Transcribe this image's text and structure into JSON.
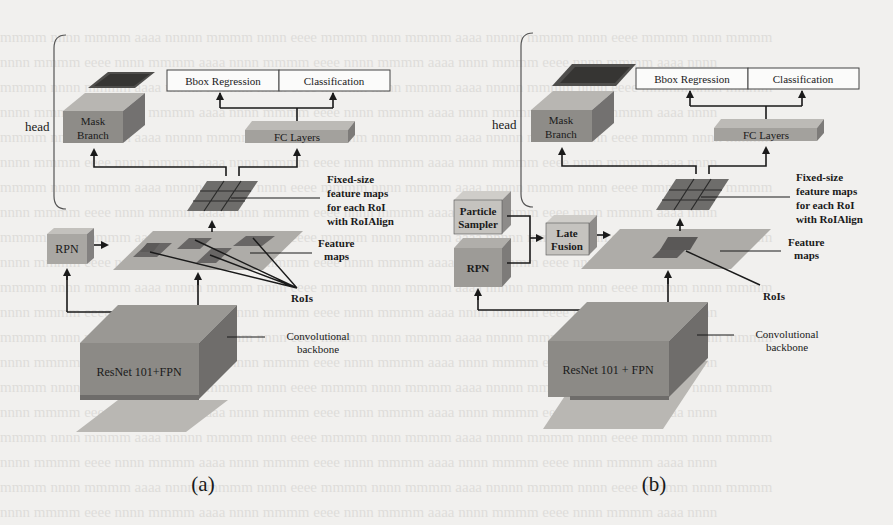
{
  "figure": {
    "panels": [
      {
        "id": "a",
        "caption": "(a)",
        "head_label": "head",
        "output_boxes": [
          "Bbox Regression",
          "Classification"
        ],
        "fc_layers": "FC Layers",
        "mask_branch": [
          "Mask",
          "Branch"
        ],
        "fixed_size_label": [
          "Fixed-size",
          "feature maps",
          "for each RoI",
          "with RoIAlign"
        ],
        "feature_maps_label": [
          "Feature",
          "maps"
        ],
        "rpn": "RPN",
        "rois_label": "RoIs",
        "backbone_label": [
          "Convolutional",
          "backbone"
        ],
        "backbone_box": "ResNet 101+FPN"
      },
      {
        "id": "b",
        "caption": "(b)",
        "head_label": "head",
        "output_boxes": [
          "Bbox Regression",
          "Classification"
        ],
        "fc_layers": "FC Layers",
        "mask_branch": [
          "Mask",
          "Branch"
        ],
        "fixed_size_label": [
          "Fixed-size",
          "feature maps",
          "for each RoI",
          "with RoIAlign"
        ],
        "feature_maps_label": [
          "Feature",
          "maps"
        ],
        "particle_sampler": [
          "Particle",
          "Sampler"
        ],
        "late_fusion": [
          "Late",
          "Fusion"
        ],
        "rpn": "RPN",
        "rois_label": "RoIs",
        "backbone_label": [
          "Convolutional",
          "backbone"
        ],
        "backbone_box": "ResNet 101 + FPN"
      }
    ],
    "colors": {
      "background": "#f1f0ee",
      "box_front": "#8e8c88",
      "box_top": "#b2b0ac",
      "box_side": "#747270",
      "light_box": "#c9c7c3",
      "feature_plane": "#aeaca8",
      "roi_patch": "#626060",
      "line": "#1a1a1a"
    }
  }
}
